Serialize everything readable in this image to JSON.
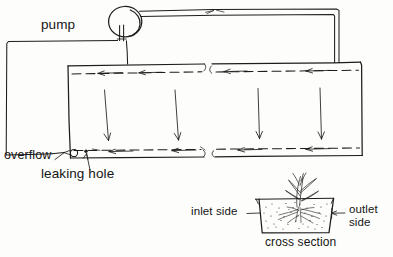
{
  "diagram": {
    "title_visible": false,
    "style": "hand-drawn line diagram, scanned black ink on white",
    "ink_color": "#1d1d1d",
    "background_color": "#fdfdfc"
  },
  "labels": {
    "pump": "pump",
    "overflow": "overflow",
    "leaking_hole": "leaking hole",
    "inlet_side": "inlet side",
    "outlet_side_line1": "outlet",
    "outlet_side_line2": "side",
    "cross_section": "cross section"
  },
  "main_view": {
    "components": [
      {
        "name": "pump",
        "shape": "circle",
        "note": "circle with short vertical double-line stem at bottom"
      },
      {
        "name": "delivery-pipe",
        "shape": "double-line tube",
        "route": "pump top-right, across to right margin, then down into tank top"
      },
      {
        "name": "treatment-tank",
        "shape": "rectangle",
        "note": "two bays, open top, water level dashed"
      },
      {
        "name": "return-pipe",
        "shape": "single line",
        "route": "pump base, left to far-left margin, down, right to overflow at tank bottom-left"
      },
      {
        "name": "overflow-port",
        "shape": "small circle at tank bottom-left"
      },
      {
        "name": "leaking-hole",
        "shape": "small solid dot right of overflow port"
      }
    ],
    "flow_arrows": {
      "surface_flow_direction": "leftward",
      "surface_arrow_count": 4,
      "bottom_flow_direction": "leftward",
      "bottom_arrow_count": 4,
      "percolation_direction": "downward",
      "percolation_arrow_count": 4
    }
  },
  "inset": {
    "name": "cross-section",
    "vessel_shape": "trapezoid trough, wide at top",
    "substrate": "stippled gravel / sand media",
    "plant": {
      "present": true,
      "leaves": "narrow pointed blades",
      "roots": "fibrous, spread through media"
    },
    "left_label": "inlet side",
    "right_label": "outlet side",
    "caption": "cross section"
  }
}
